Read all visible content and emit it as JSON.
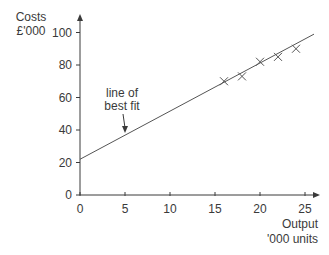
{
  "chart_data": {
    "type": "scatter",
    "title": "",
    "ylabel_line1": "Costs",
    "ylabel_line2": "£'000",
    "xlabel_line1": "Output",
    "xlabel_line2": "'000 units",
    "xlim": [
      0,
      26
    ],
    "ylim": [
      0,
      105
    ],
    "x_ticks": [
      0,
      5,
      10,
      15,
      20,
      25
    ],
    "y_ticks": [
      0,
      20,
      40,
      60,
      80,
      100
    ],
    "grid": false,
    "legend": null,
    "series": [
      {
        "name": "observations",
        "marker": "x",
        "x": [
          16,
          18,
          20,
          22,
          24
        ],
        "y": [
          70,
          73,
          82,
          85,
          90
        ]
      }
    ],
    "trendline": {
      "name": "line of best fit",
      "x": [
        0,
        26
      ],
      "y": [
        22,
        99
      ]
    },
    "annotations": [
      {
        "text_line1": "line of",
        "text_line2": "best fit",
        "points_to": [
          5,
          37
        ]
      }
    ]
  },
  "style": {
    "axis_color": "#3a3a3a",
    "line_color": "#555555",
    "text_color": "#3a3a3a"
  }
}
